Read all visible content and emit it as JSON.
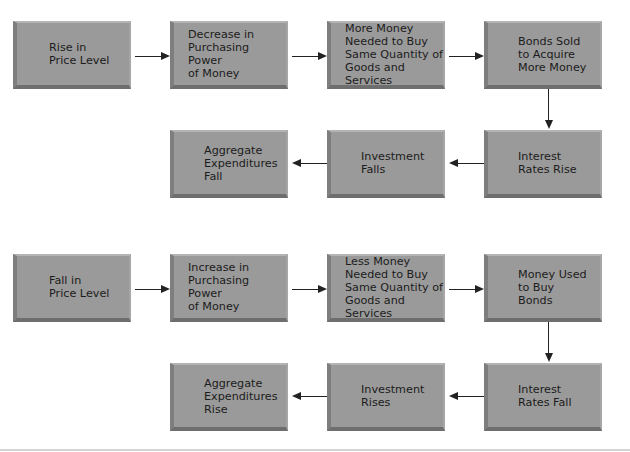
{
  "diagram": {
    "colors": {
      "box_fill": "#9a9a9a",
      "box_shadow": "#6e6e6e",
      "text": "#1c1c1c",
      "arrow": "#222222",
      "background": "#ffffff"
    },
    "upper_chain": {
      "nodes": [
        {
          "id": "rise-price-level",
          "label": "Rise in\nPrice Level"
        },
        {
          "id": "decrease-purchasing-power",
          "label": "Decrease in\nPurchasing Power\nof Money"
        },
        {
          "id": "more-money-needed",
          "label": "More Money\nNeeded to Buy\nSame Quantity of\nGoods and Services"
        },
        {
          "id": "bonds-sold",
          "label": "Bonds Sold\nto Acquire\nMore Money"
        },
        {
          "id": "interest-rates-rise",
          "label": "Interest\nRates Rise"
        },
        {
          "id": "investment-falls",
          "label": "Investment\nFalls"
        },
        {
          "id": "aggregate-expenditures-fall",
          "label": "Aggregate\nExpenditures\nFall"
        }
      ],
      "edges": [
        [
          "rise-price-level",
          "decrease-purchasing-power"
        ],
        [
          "decrease-purchasing-power",
          "more-money-needed"
        ],
        [
          "more-money-needed",
          "bonds-sold"
        ],
        [
          "bonds-sold",
          "interest-rates-rise"
        ],
        [
          "interest-rates-rise",
          "investment-falls"
        ],
        [
          "investment-falls",
          "aggregate-expenditures-fall"
        ]
      ]
    },
    "lower_chain": {
      "nodes": [
        {
          "id": "fall-price-level",
          "label": "Fall in\nPrice Level"
        },
        {
          "id": "increase-purchasing-power",
          "label": "Increase in\nPurchasing Power\nof Money"
        },
        {
          "id": "less-money-needed",
          "label": "Less Money\nNeeded to Buy\nSame Quantity of\nGoods and Services"
        },
        {
          "id": "money-used-buy-bonds",
          "label": "Money Used\nto Buy\nBonds"
        },
        {
          "id": "interest-rates-fall",
          "label": "Interest\nRates Fall"
        },
        {
          "id": "investment-rises",
          "label": "Investment\nRises"
        },
        {
          "id": "aggregate-expenditures-rise",
          "label": "Aggregate\nExpenditures\nRise"
        }
      ],
      "edges": [
        [
          "fall-price-level",
          "increase-purchasing-power"
        ],
        [
          "increase-purchasing-power",
          "less-money-needed"
        ],
        [
          "less-money-needed",
          "money-used-buy-bonds"
        ],
        [
          "money-used-buy-bonds",
          "interest-rates-fall"
        ],
        [
          "interest-rates-fall",
          "investment-rises"
        ],
        [
          "investment-rises",
          "aggregate-expenditures-rise"
        ]
      ]
    }
  }
}
